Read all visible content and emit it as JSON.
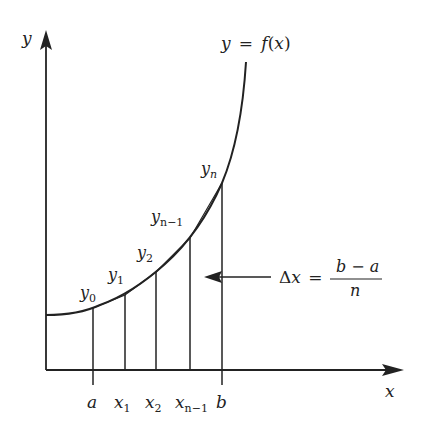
{
  "diagram": {
    "colors": {
      "ink": "#222222",
      "background": "#ffffff"
    },
    "axes": {
      "y_label": "y",
      "x_label": "x"
    },
    "curve_label": "y = f(x)",
    "curve_label_parts": {
      "lhs": "y",
      "eq": "=",
      "f": "f",
      "open": "(",
      "x": "x",
      "close": ")"
    },
    "x_ticks": [
      {
        "main": "a",
        "sub": ""
      },
      {
        "main": "x",
        "sub": "1"
      },
      {
        "main": "x",
        "sub": "2"
      },
      {
        "main": "x",
        "sub": "n−1"
      },
      {
        "main": "b",
        "sub": ""
      }
    ],
    "y_points": [
      {
        "main": "y",
        "sub": "0"
      },
      {
        "main": "y",
        "sub": "1"
      },
      {
        "main": "y",
        "sub": "2"
      },
      {
        "main": "y",
        "sub": "n−1"
      },
      {
        "main": "y",
        "sub": "n"
      }
    ],
    "delta_annotation": {
      "delta": "Δ",
      "x": "x",
      "eq": "=",
      "numerator": "b − a",
      "denominator": "n"
    }
  }
}
